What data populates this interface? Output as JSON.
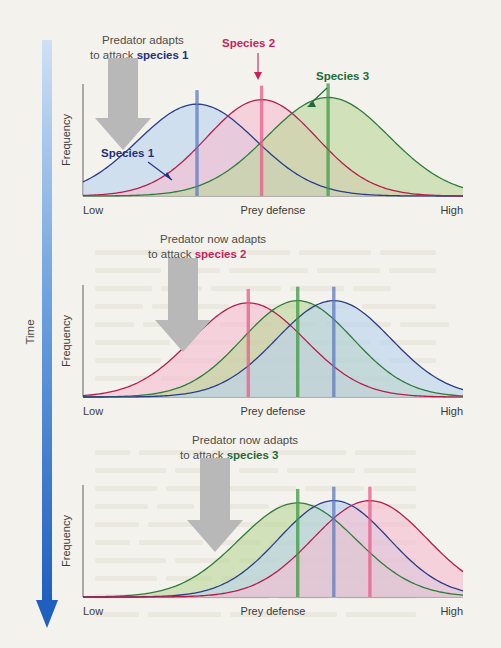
{
  "figure": {
    "background_color": "#f4f2ec",
    "time_axis": {
      "label": "Time",
      "direction": "downward",
      "color_top": "#cfe0f5",
      "color_bottom": "#1f5fbf"
    }
  },
  "species": [
    {
      "id": "species1",
      "name": "Species 1",
      "fill": "#b9d4ef",
      "stroke": "#2b3f86",
      "marker": "#5d79c0"
    },
    {
      "id": "species2",
      "name": "Species 2",
      "fill": "#f5bdd0",
      "stroke": "#b51f50",
      "marker": "#e85b89"
    },
    {
      "id": "species3",
      "name": "Species 3",
      "fill": "#bcd79a",
      "stroke": "#2f7c3b",
      "marker": "#3f9a45"
    }
  ],
  "axes": {
    "y_label": "Frequency",
    "x_label": "Prey defense",
    "x_min_label": "Low",
    "x_max_label": "High"
  },
  "panels": [
    {
      "index": 1,
      "callout_line1": "Predator adapts",
      "callout_line2_prefix": "to attack ",
      "callout_line2_target": "species 1",
      "callout_target_species": "species1",
      "arrow": {
        "direction": "down",
        "color": "#b6b6b6"
      },
      "annotations": [
        {
          "text": "Species 1",
          "species": "species1",
          "arrow": "down-right"
        },
        {
          "text": "Species 2",
          "species": "species2",
          "arrow": "down"
        },
        {
          "text": "Species 3",
          "species": "species3",
          "arrow": "down-left"
        }
      ],
      "curves": [
        {
          "species": "species1",
          "peak_x": 0.3,
          "height": 0.82,
          "width": 0.155
        },
        {
          "species": "species2",
          "peak_x": 0.47,
          "height": 0.86,
          "width": 0.145
        },
        {
          "species": "species3",
          "peak_x": 0.645,
          "height": 0.88,
          "width": 0.16
        }
      ]
    },
    {
      "index": 2,
      "callout_line1": "Predator now adapts",
      "callout_line2_prefix": "to attack ",
      "callout_line2_target": "species 2",
      "callout_target_species": "species2",
      "arrow": {
        "direction": "down",
        "color": "#b6b6b6"
      },
      "annotations": [],
      "curves": [
        {
          "species": "species2",
          "peak_x": 0.435,
          "height": 0.84,
          "width": 0.15
        },
        {
          "species": "species3",
          "peak_x": 0.565,
          "height": 0.86,
          "width": 0.145
        },
        {
          "species": "species1",
          "peak_x": 0.66,
          "height": 0.86,
          "width": 0.15
        }
      ]
    },
    {
      "index": 3,
      "callout_line1": "Predator now adapts",
      "callout_line2_prefix": "to attack ",
      "callout_line2_target": "species 3",
      "callout_target_species": "species3",
      "arrow": {
        "direction": "down",
        "color": "#b6b6b6"
      },
      "annotations": [],
      "curves": [
        {
          "species": "species3",
          "peak_x": 0.565,
          "height": 0.84,
          "width": 0.155
        },
        {
          "species": "species1",
          "peak_x": 0.66,
          "height": 0.86,
          "width": 0.145
        },
        {
          "species": "species2",
          "peak_x": 0.755,
          "height": 0.86,
          "width": 0.15
        }
      ]
    }
  ],
  "chart_data": {
    "type": "line",
    "title": "",
    "xlabel": "Prey defense",
    "ylabel": "Frequency",
    "xlim": [
      0,
      1
    ],
    "ylim": [
      0,
      1
    ],
    "grid": false,
    "legend": "inline-annotations",
    "panels": [
      {
        "name": "Time 1",
        "annotation": "Predator adapts to attack species 1",
        "series": [
          {
            "name": "Species 1",
            "peak": 0.3,
            "relative_height": 0.82,
            "sd": 0.155
          },
          {
            "name": "Species 2",
            "peak": 0.47,
            "relative_height": 0.86,
            "sd": 0.145
          },
          {
            "name": "Species 3",
            "peak": 0.645,
            "relative_height": 0.88,
            "sd": 0.16
          }
        ]
      },
      {
        "name": "Time 2",
        "annotation": "Predator now adapts to attack species 2",
        "series": [
          {
            "name": "Species 2",
            "peak": 0.435,
            "relative_height": 0.84,
            "sd": 0.15
          },
          {
            "name": "Species 3",
            "peak": 0.565,
            "relative_height": 0.86,
            "sd": 0.145
          },
          {
            "name": "Species 1",
            "peak": 0.66,
            "relative_height": 0.86,
            "sd": 0.15
          }
        ]
      },
      {
        "name": "Time 3",
        "annotation": "Predator now adapts to attack species 3",
        "series": [
          {
            "name": "Species 3",
            "peak": 0.565,
            "relative_height": 0.84,
            "sd": 0.155
          },
          {
            "name": "Species 1",
            "peak": 0.66,
            "relative_height": 0.86,
            "sd": 0.145
          },
          {
            "name": "Species 2",
            "peak": 0.755,
            "relative_height": 0.86,
            "sd": 0.15
          }
        ]
      }
    ]
  }
}
